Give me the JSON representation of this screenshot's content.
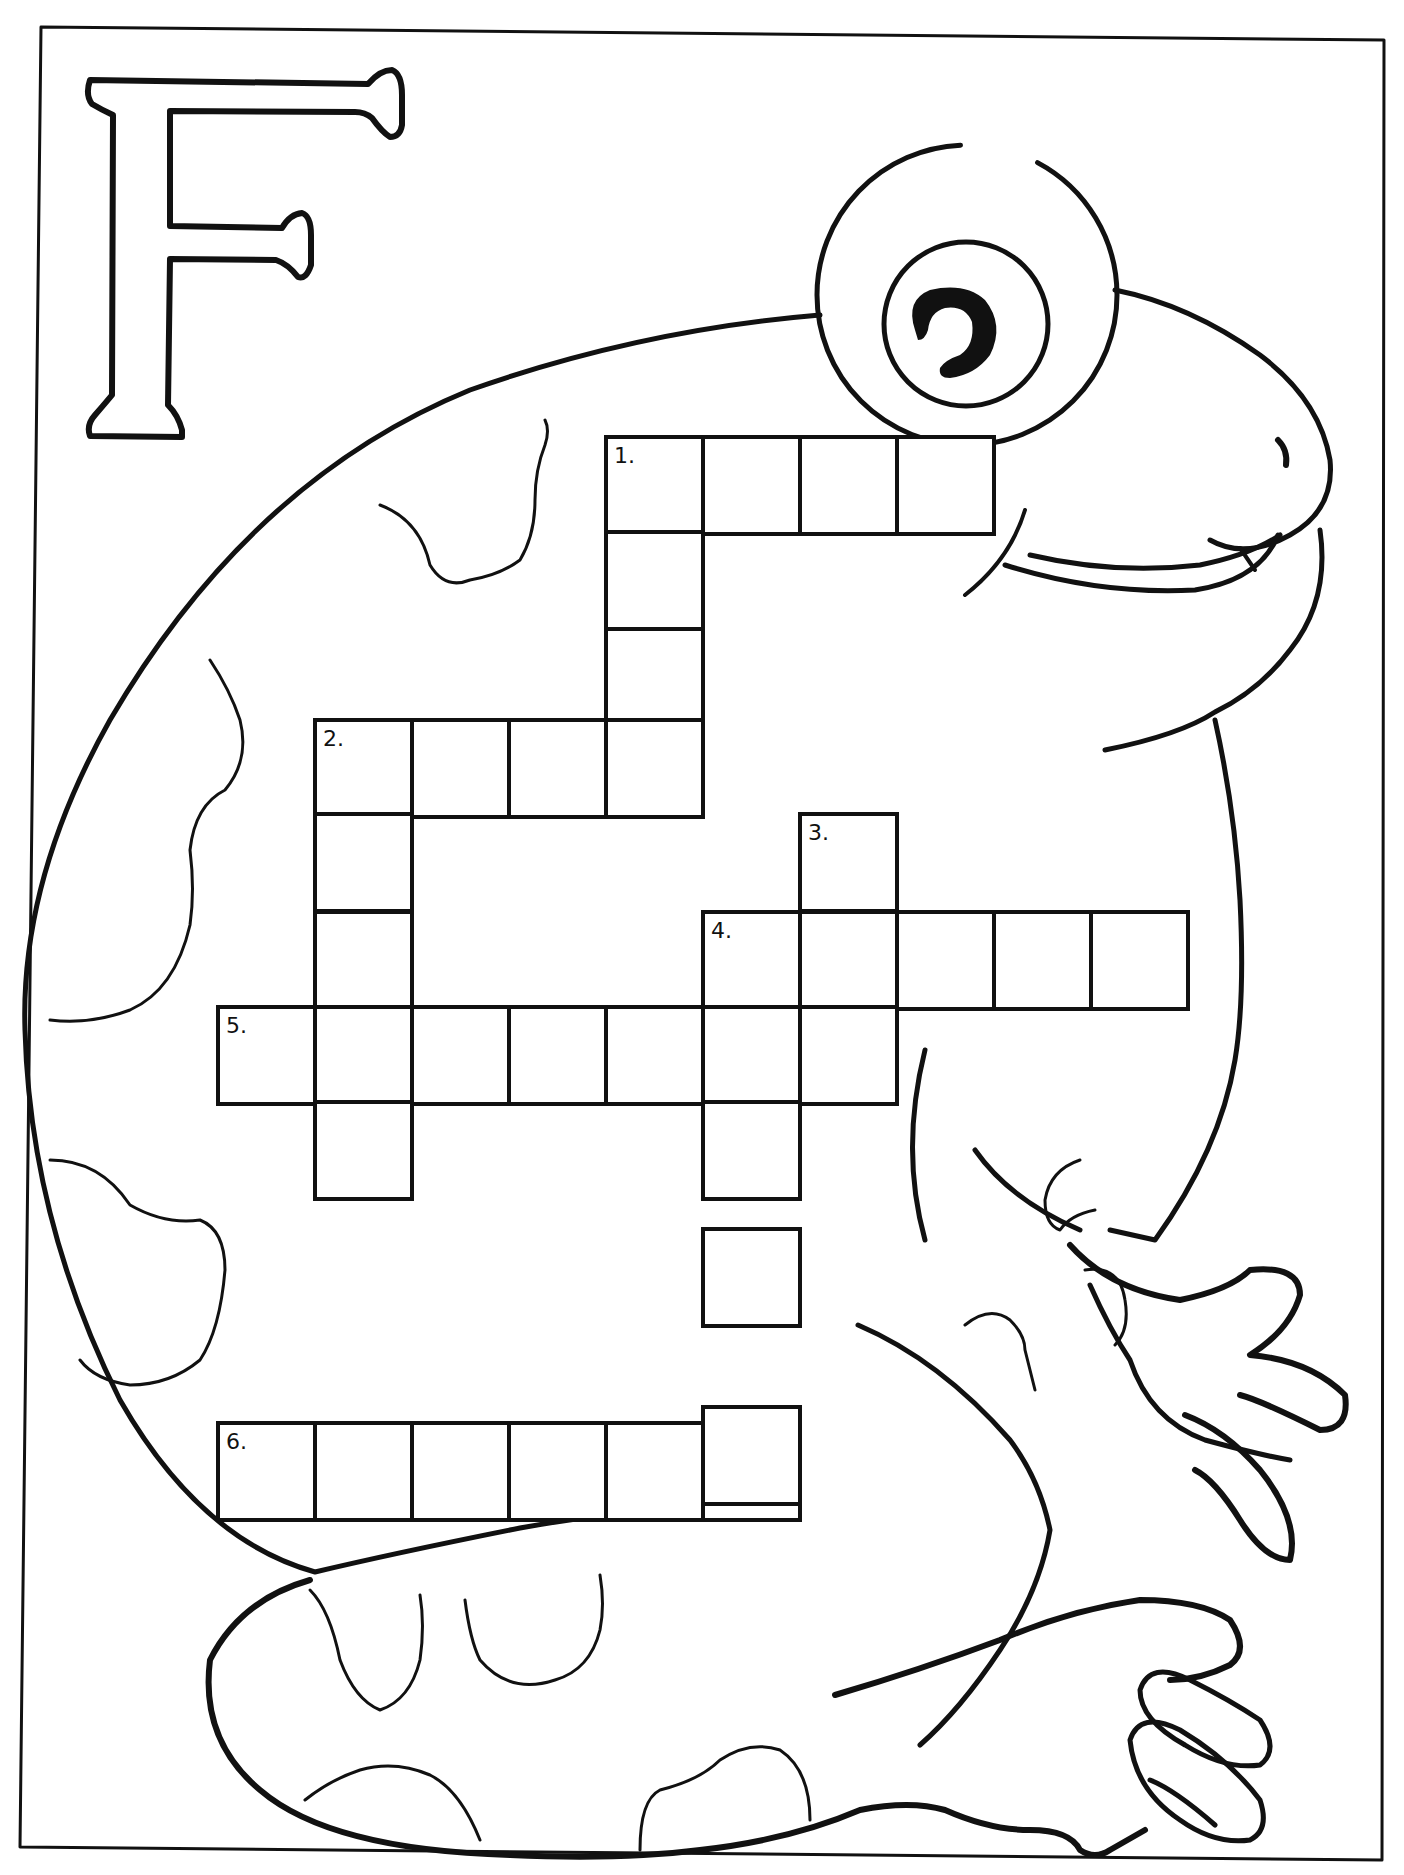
{
  "page": {
    "letter": "F",
    "theme": "Frog",
    "colors": {
      "ink": "#111111",
      "paper": "#ffffff"
    }
  },
  "crossword": {
    "cell_size": 97,
    "clues": [
      {
        "number": "1.",
        "direction": "across",
        "length": 4,
        "col": 3,
        "row": 0
      },
      {
        "number": "1.",
        "direction": "down",
        "length": 4,
        "col": 3,
        "row": 0
      },
      {
        "number": "2.",
        "direction": "across",
        "length": 4,
        "col": 0,
        "row": 3
      },
      {
        "number": "2.",
        "direction": "down",
        "length": 5,
        "col": 0,
        "row": 3
      },
      {
        "number": "3.",
        "direction": "down",
        "length": 3,
        "col": 5,
        "row": 4
      },
      {
        "number": "4.",
        "direction": "across",
        "length": 5,
        "col": 4,
        "row": 5
      },
      {
        "number": "4.",
        "direction": "down",
        "length": 6,
        "col": 4,
        "row": 5
      },
      {
        "number": "5.",
        "direction": "across",
        "length": 7,
        "col": -1,
        "row": 6
      },
      {
        "number": "6.",
        "direction": "across",
        "length": 6,
        "col": -1,
        "row": 9
      }
    ],
    "labels": {
      "n1": "1.",
      "n2": "2.",
      "n3": "3.",
      "n4": "4.",
      "n5": "5.",
      "n6": "6."
    }
  }
}
